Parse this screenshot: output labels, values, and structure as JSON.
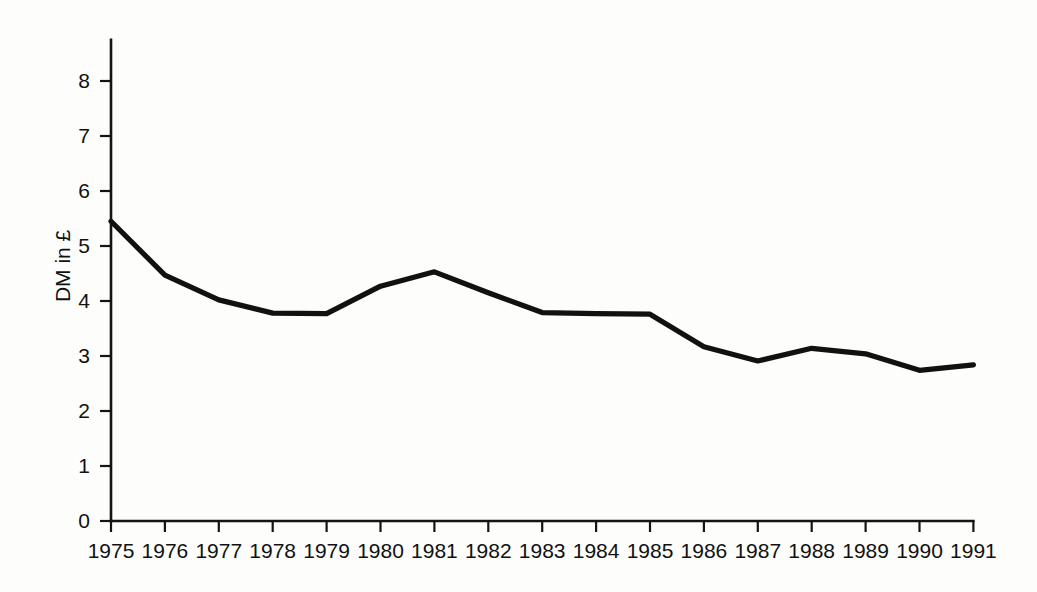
{
  "chart_data": {
    "type": "line",
    "title": "",
    "xlabel": "",
    "ylabel": "DM in £",
    "categories": [
      "1975",
      "1976",
      "1977",
      "1978",
      "1979",
      "1980",
      "1981",
      "1982",
      "1983",
      "1984",
      "1985",
      "1986",
      "1987",
      "1988",
      "1989",
      "1990",
      "1991"
    ],
    "values": [
      5.45,
      4.47,
      4.02,
      3.78,
      3.77,
      4.27,
      4.53,
      4.15,
      3.79,
      3.77,
      3.76,
      3.17,
      2.91,
      3.14,
      3.04,
      2.74,
      2.84
    ],
    "series": [
      {
        "name": "DM in £",
        "values": [
          5.45,
          4.47,
          4.02,
          3.78,
          3.77,
          4.27,
          4.53,
          4.15,
          3.79,
          3.77,
          3.76,
          3.17,
          2.91,
          3.14,
          3.04,
          2.74,
          2.84
        ]
      }
    ],
    "ylim": [
      0,
      8.75
    ],
    "yticks": [
      0,
      1,
      2,
      3,
      4,
      5,
      6,
      7,
      8
    ],
    "ytick_labels": [
      "0",
      "1",
      "2",
      "3",
      "4",
      "5",
      "6",
      "7",
      "8"
    ],
    "xtick_labels": [
      "1975",
      "1976",
      "1977",
      "1978",
      "1979",
      "1980",
      "1981",
      "1982",
      "1983",
      "1984",
      "1985",
      "1986",
      "1987",
      "1988",
      "1989",
      "1990",
      "1991"
    ],
    "grid": false,
    "legend": "none",
    "line_color": "#111111",
    "axis_color": "#141414",
    "background_color": "#fdfdfc"
  }
}
